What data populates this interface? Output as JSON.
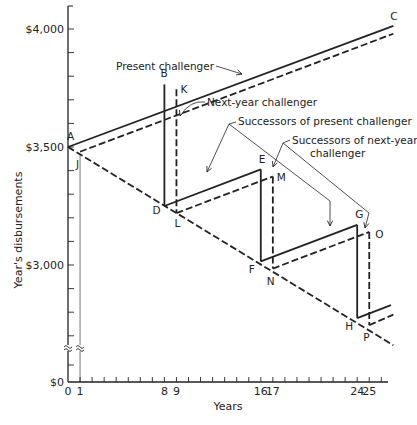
{
  "chart_data": {
    "type": "line",
    "title": "",
    "xlabel": "Years",
    "ylabel": "Year's disbursements",
    "xlim": [
      0,
      27
    ],
    "ylim_broken": {
      "bottom": 0,
      "break_from": 2600,
      "top": 4100
    },
    "x_ticks": [
      0,
      1,
      8,
      9,
      16,
      17,
      24,
      25
    ],
    "x_minor_step": 1,
    "y_ticks": [
      {
        "value": 4000,
        "label": "$4,000"
      },
      {
        "value": 3500,
        "label": "$3,500"
      },
      {
        "value": 3000,
        "label": "$3,000"
      },
      {
        "value": 0,
        "label": "$0"
      }
    ],
    "y_minor_step": 100,
    "axis_break_symbol": "≈",
    "series": [
      {
        "name": "Present challenger",
        "style": "solid",
        "points": [
          [
            0,
            3500
          ],
          [
            27,
            4013
          ]
        ]
      },
      {
        "name": "Next-year challenger",
        "style": "dashed",
        "points": [
          [
            1,
            3480
          ],
          [
            27,
            3980
          ]
        ]
      },
      {
        "name": "Defender decline",
        "style": "dashed",
        "points": [
          [
            0,
            3500
          ],
          [
            27,
            2660
          ]
        ]
      },
      {
        "name": "Successors of present challenger",
        "style": "solid",
        "segments": [
          [
            [
              8,
              3765
            ],
            [
              8,
              3250
            ]
          ],
          [
            [
              8,
              3250
            ],
            [
              16,
              3405
            ]
          ],
          [
            [
              16,
              3405
            ],
            [
              16,
              3015
            ]
          ],
          [
            [
              16,
              3015
            ],
            [
              24,
              3170
            ]
          ],
          [
            [
              24,
              3170
            ],
            [
              24,
              2775
            ]
          ],
          [
            [
              24,
              2775
            ],
            [
              26.8,
              2830
            ]
          ]
        ]
      },
      {
        "name": "Successors of next-year challenger",
        "style": "dashed",
        "segments": [
          [
            [
              9,
              3745
            ],
            [
              9,
              3220
            ]
          ],
          [
            [
              9,
              3220
            ],
            [
              17,
              3375
            ]
          ],
          [
            [
              17,
              3375
            ],
            [
              17,
              2985
            ]
          ],
          [
            [
              17,
              2985
            ],
            [
              25,
              3140
            ]
          ],
          [
            [
              25,
              3140
            ],
            [
              25,
              2745
            ]
          ],
          [
            [
              25,
              2745
            ],
            [
              27,
              2790
            ]
          ]
        ]
      }
    ],
    "point_labels": [
      {
        "label": "A",
        "x": 0,
        "y": 3500
      },
      {
        "label": "B",
        "x": 8,
        "y": 3765
      },
      {
        "label": "C",
        "x": 27,
        "y": 4013
      },
      {
        "label": "D",
        "x": 8,
        "y": 3250
      },
      {
        "label": "E",
        "x": 16,
        "y": 3405
      },
      {
        "label": "F",
        "x": 16,
        "y": 3015
      },
      {
        "label": "G",
        "x": 24,
        "y": 3170
      },
      {
        "label": "H",
        "x": 24,
        "y": 2775
      },
      {
        "label": "J",
        "x": 1,
        "y": 3470
      },
      {
        "label": "K",
        "x": 9,
        "y": 3745
      },
      {
        "label": "L",
        "x": 9,
        "y": 3220
      },
      {
        "label": "M",
        "x": 17,
        "y": 3375
      },
      {
        "label": "N",
        "x": 17,
        "y": 2985
      },
      {
        "label": "O",
        "x": 25,
        "y": 3140
      },
      {
        "label": "P",
        "x": 25,
        "y": 2745
      }
    ],
    "annotations": [
      {
        "text": "Present challenger"
      },
      {
        "text": "Next-year challenger"
      },
      {
        "text": "Successors of present challenger"
      },
      {
        "text_lines": [
          "Successors of next-year",
          "challenger"
        ]
      }
    ],
    "grid": false,
    "legend": "none"
  }
}
